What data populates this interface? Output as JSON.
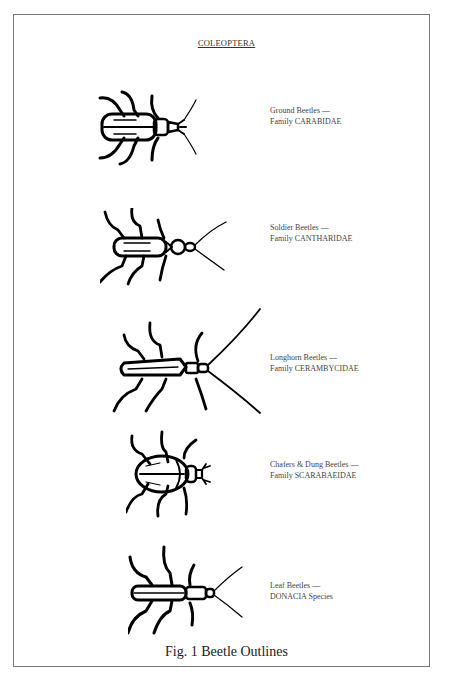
{
  "page": {
    "title": "COLEOPTERA",
    "figure_caption": "Fig. 1 Beetle Outlines"
  },
  "beetles": [
    {
      "name_line": "Ground Beetles —",
      "family_line": "Family CARABIDAE",
      "icon": "ground-beetle-outline"
    },
    {
      "name_line": "Soldier Beetles —",
      "family_line": "Family CANTHARIDAE",
      "icon": "soldier-beetle-outline"
    },
    {
      "name_line": "Longhorn Beetles —",
      "family_line": "Family CERAMBYCIDAE",
      "icon": "longhorn-beetle-outline"
    },
    {
      "name_line": "Chafers & Dung Beetles —",
      "family_line": "Family SCARABAEIDAE",
      "icon": "chafer-beetle-outline"
    },
    {
      "name_line": "Leaf Beetles —",
      "family_line": "DONACIA Species",
      "icon": "leaf-beetle-outline"
    }
  ],
  "colors": {
    "ink": "#000000",
    "frame": "#777777",
    "text": "#444444",
    "background": "#ffffff"
  }
}
